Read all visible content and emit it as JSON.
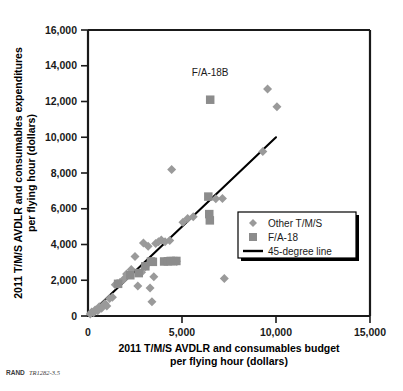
{
  "source_note": {
    "prefix": "RAND",
    "id": "TR1282-3.5"
  },
  "annotations": [
    {
      "text": "F/A-18B",
      "x": 6500,
      "y": 13400
    }
  ],
  "legend": {
    "position": "inside-right",
    "entries": [
      {
        "label": "Other T/M/S",
        "marker": "diamond",
        "color": "#9a9a9a"
      },
      {
        "label": "F/A-18",
        "marker": "square",
        "color": "#8c8c8c"
      },
      {
        "label": "45-degree line",
        "marker": "line",
        "color": "#000000"
      }
    ]
  },
  "chart_data": {
    "type": "scatter",
    "title": "",
    "xlabel": "2011 T/M/S AVDLR and consumables budget per flying hour (dollars)",
    "xlabel_line1": "2011 T/M/S AVDLR and consumables budget",
    "xlabel_line2": "per flying hour (dollars)",
    "ylabel": "2011 T/M/S AVDLR and consumables expenditures per flying hour (dollars)",
    "ylabel_line1": "2011 T/M/S AVDLR and consumables expenditures",
    "ylabel_line2": "per flying hour (dollars)",
    "xlim": [
      0,
      15000
    ],
    "ylim": [
      0,
      16000
    ],
    "xticks": [
      0,
      5000,
      10000,
      15000
    ],
    "xtick_labels": [
      "0",
      "5,000",
      "10,000",
      "15,000"
    ],
    "yticks": [
      0,
      2000,
      4000,
      6000,
      8000,
      10000,
      12000,
      14000,
      16000
    ],
    "ytick_labels": [
      "0",
      "2,000",
      "4,000",
      "6,000",
      "8,000",
      "10,000",
      "12,000",
      "14,000",
      "16,000"
    ],
    "grid": false,
    "reference_line": {
      "name": "45-degree line",
      "type": "line",
      "slope": 1,
      "intercept": 0,
      "x_start": 0,
      "y_start": 0,
      "x_end": 10000,
      "y_end": 10000,
      "color": "#000000"
    },
    "series": [
      {
        "name": "Other T/M/S",
        "marker": "diamond",
        "color": "#9a9a9a",
        "points": [
          [
            120,
            110
          ],
          [
            200,
            230
          ],
          [
            300,
            180
          ],
          [
            380,
            330
          ],
          [
            520,
            300
          ],
          [
            600,
            520
          ],
          [
            720,
            430
          ],
          [
            900,
            700
          ],
          [
            1000,
            560
          ],
          [
            1150,
            980
          ],
          [
            1300,
            1050
          ],
          [
            1450,
            1750
          ],
          [
            1550,
            1820
          ],
          [
            1700,
            1880
          ],
          [
            1900,
            2050
          ],
          [
            2050,
            2350
          ],
          [
            2300,
            2600
          ],
          [
            2500,
            3330
          ],
          [
            2650,
            1680
          ],
          [
            2850,
            2450
          ],
          [
            2950,
            4080
          ],
          [
            3050,
            2750
          ],
          [
            3200,
            3900
          ],
          [
            3300,
            1560
          ],
          [
            3400,
            800
          ],
          [
            3500,
            2200
          ],
          [
            3600,
            4050
          ],
          [
            3750,
            4150
          ],
          [
            3900,
            4250
          ],
          [
            4100,
            4150
          ],
          [
            4350,
            4230
          ],
          [
            4450,
            8200
          ],
          [
            4700,
            3060
          ],
          [
            5050,
            5250
          ],
          [
            5300,
            5450
          ],
          [
            5600,
            5550
          ],
          [
            6800,
            6560
          ],
          [
            7150,
            6580
          ],
          [
            7250,
            2100
          ],
          [
            9300,
            9200
          ],
          [
            9550,
            12700
          ],
          [
            10050,
            11700
          ]
        ]
      },
      {
        "name": "F/A-18",
        "marker": "square",
        "color": "#8c8c8c",
        "points": [
          [
            1600,
            1800
          ],
          [
            2250,
            2280
          ],
          [
            2700,
            2400
          ],
          [
            3050,
            2780
          ],
          [
            3350,
            3050
          ],
          [
            3450,
            3030
          ],
          [
            4050,
            3050
          ],
          [
            4250,
            3060
          ],
          [
            4400,
            3080
          ],
          [
            4550,
            3070
          ],
          [
            4700,
            3080
          ],
          [
            6400,
            6680
          ],
          [
            6450,
            5700
          ],
          [
            6480,
            5350
          ],
          [
            6500,
            12100
          ]
        ]
      }
    ]
  }
}
